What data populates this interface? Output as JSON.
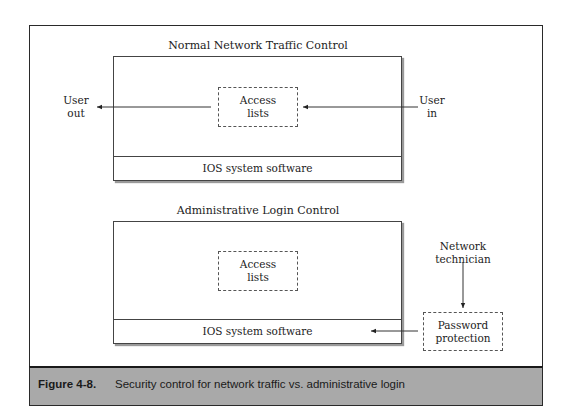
{
  "diagram": {
    "top_section": {
      "title": "Normal Network Traffic Control",
      "access_box": {
        "line1": "Access",
        "line2": "lists"
      },
      "ios_label": "IOS system software",
      "user_out": {
        "line1": "User",
        "line2": "out"
      },
      "user_in": {
        "line1": "User",
        "line2": "in"
      }
    },
    "bottom_section": {
      "title": "Administrative Login Control",
      "access_box": {
        "line1": "Access",
        "line2": "lists"
      },
      "ios_label": "IOS system software",
      "technician": {
        "line1": "Network",
        "line2": "technician"
      },
      "password_box": {
        "line1": "Password",
        "line2": "protection"
      }
    }
  },
  "caption": {
    "number": "Figure 4-8.",
    "text": "Security control for network traffic vs. administrative login"
  },
  "colors": {
    "caption_bg": "#a9a9a9",
    "line": "#2a2a2a"
  }
}
